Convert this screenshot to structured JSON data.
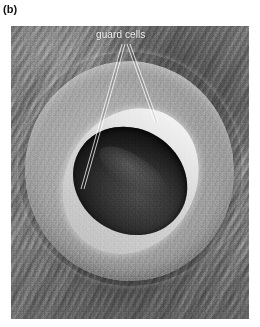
{
  "figure": {
    "panel_label": "(b)",
    "panel_label_color": "#111111",
    "caption_present": false
  },
  "micrograph": {
    "subject": "stoma-scanning-electron-micrograph",
    "frame": {
      "x": 11,
      "y": 26,
      "width": 238,
      "height": 293
    },
    "background_color": "#8d8d8d",
    "annotations": [
      {
        "id": "guard-cells",
        "label": "guard cells",
        "text_color": "#f2f2f2",
        "text_position": {
          "x": 96,
          "y": 29
        },
        "leader_lines": [
          {
            "from": {
              "x": 122,
              "y": 18
            },
            "to": {
              "x": 71,
              "y": 163
            }
          },
          {
            "from": {
              "x": 126,
              "y": 18
            },
            "to": {
              "x": 145,
              "y": 96
            }
          }
        ],
        "leader_line_color": "#ffffff"
      }
    ],
    "features": [
      {
        "name": "guard-cell-complex",
        "description": "raised elliptical pair of guard cells"
      },
      {
        "name": "stomatal-pore",
        "description": "dark elongated slit between the guard cells"
      },
      {
        "name": "epidermal-cuticle-striations",
        "description": "wavy parallel ridges of the leaf surface"
      }
    ]
  }
}
